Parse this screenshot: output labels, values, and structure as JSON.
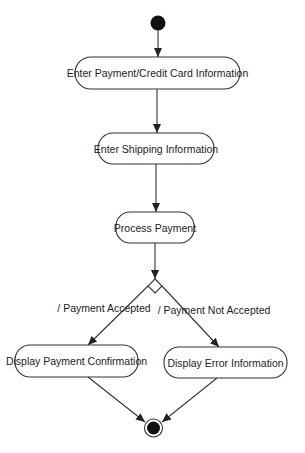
{
  "diagram": {
    "type": "uml-activity",
    "colors": {
      "stroke": "#333333",
      "fill": "#ffffff",
      "node_fill_solid": "#111111",
      "text": "#222222"
    },
    "start_node": {
      "label": "initial"
    },
    "end_node": {
      "label": "final"
    },
    "activities": [
      {
        "id": "a1",
        "label": "Enter Payment/Credit Card Information"
      },
      {
        "id": "a2",
        "label": "Enter Shipping Information"
      },
      {
        "id": "a3",
        "label": "Process Payment"
      },
      {
        "id": "a4",
        "label": "Display Payment Confirmation"
      },
      {
        "id": "a5",
        "label": "Display Error Information"
      }
    ],
    "decision": {
      "id": "d1"
    },
    "guards": [
      {
        "from": "d1",
        "to": "a4",
        "label": "/ Payment Accepted"
      },
      {
        "from": "d1",
        "to": "a5",
        "label": "/ Payment Not Accepted"
      }
    ],
    "edges": [
      {
        "from": "start",
        "to": "a1"
      },
      {
        "from": "a1",
        "to": "a2"
      },
      {
        "from": "a2",
        "to": "a3"
      },
      {
        "from": "a3",
        "to": "d1"
      },
      {
        "from": "d1",
        "to": "a4"
      },
      {
        "from": "d1",
        "to": "a5"
      },
      {
        "from": "a4",
        "to": "end"
      },
      {
        "from": "a5",
        "to": "end"
      }
    ]
  }
}
